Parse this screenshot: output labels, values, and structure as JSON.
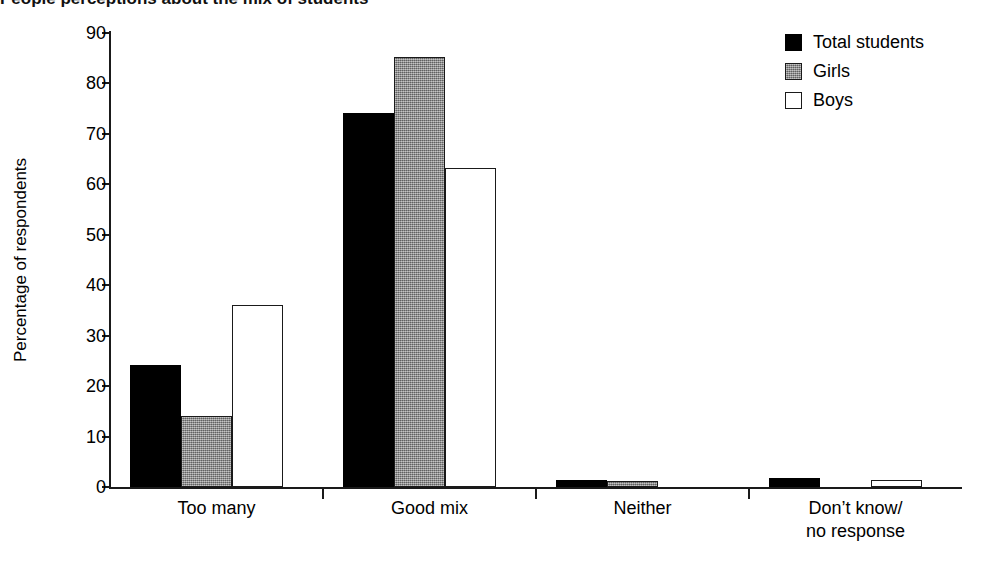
{
  "title": "People perceptions about the mix of students",
  "chart_data": {
    "type": "bar",
    "title": "",
    "xlabel": "",
    "ylabel": "Percentage of respondents",
    "ylim": [
      0,
      90
    ],
    "ytick_step": 10,
    "yticks": [
      "90",
      "80",
      "70",
      "60",
      "50",
      "40",
      "30",
      "20",
      "10",
      "0"
    ],
    "grid": false,
    "legend_position": "top-right",
    "categories": [
      "Too many",
      "Good mix",
      "Neither",
      "Don’t know/\nno response"
    ],
    "series": [
      {
        "name": "Total students",
        "color": "#000000",
        "style": "solid-black",
        "values": [
          24.2,
          74.1,
          1.3,
          1.7
        ]
      },
      {
        "name": "Girls",
        "color": "#8d8d8d",
        "style": "halftone-gray",
        "values": [
          14.0,
          85.2,
          1.2,
          0.0
        ]
      },
      {
        "name": "Boys",
        "color": "#ffffff",
        "style": "outline-white",
        "values": [
          36.1,
          63.3,
          0.0,
          1.4
        ]
      }
    ]
  },
  "legend": {
    "items": [
      {
        "label": "Total students",
        "swatch": "black"
      },
      {
        "label": "Girls",
        "swatch": "gray"
      },
      {
        "label": "Boys",
        "swatch": "white"
      }
    ]
  }
}
